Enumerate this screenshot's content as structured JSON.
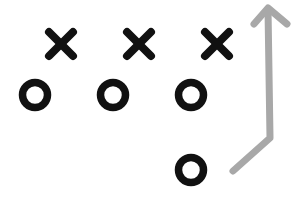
{
  "diagram": {
    "type": "football-play",
    "colors": {
      "background": "#ffffff",
      "symbols": "#111111",
      "route": "#a8a8a8"
    },
    "defenders_x": [
      {
        "label": "X",
        "cx": 61,
        "cy": 44
      },
      {
        "label": "X",
        "cx": 139,
        "cy": 44
      },
      {
        "label": "X",
        "cx": 217,
        "cy": 44
      }
    ],
    "offense_o": [
      {
        "label": "O",
        "cx": 35,
        "cy": 95
      },
      {
        "label": "O",
        "cx": 113,
        "cy": 95
      },
      {
        "label": "O",
        "cx": 191,
        "cy": 95
      },
      {
        "label": "O",
        "cx": 191,
        "cy": 170
      }
    ],
    "route_arrow": {
      "points": [
        [
          233,
          171
        ],
        [
          270,
          138
        ],
        [
          268,
          9
        ]
      ],
      "head": [
        [
          254,
          24
        ],
        [
          268,
          8
        ],
        [
          287,
          24
        ]
      ]
    }
  }
}
